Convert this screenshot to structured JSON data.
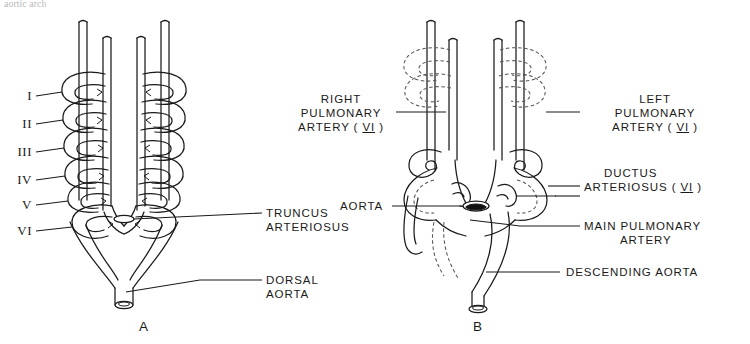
{
  "figure": {
    "top_cropped_text": "aortic arch",
    "panels": [
      {
        "id": "A",
        "letter": "A"
      },
      {
        "id": "B",
        "letter": "B"
      }
    ]
  },
  "arch_numerals": [
    {
      "label": "I",
      "arch": 1
    },
    {
      "label": "II",
      "arch": 2
    },
    {
      "label": "III",
      "arch": 3
    },
    {
      "label": "IV",
      "arch": 4
    },
    {
      "label": "V",
      "arch": 5
    },
    {
      "label": "VI",
      "arch": 6
    }
  ],
  "panel_a_labels": {
    "truncus_line1": "TRUNCUS",
    "truncus_line2": "ARTERIOSUS",
    "dorsal_line1": "DORSAL",
    "dorsal_line2": "AORTA"
  },
  "panel_b_labels": {
    "right_pa_line1": "RIGHT",
    "right_pa_line2": "PULMONARY",
    "right_pa_line3_pre": "ARTERY ( ",
    "right_pa_numeral": "VI",
    "right_pa_line3_post": " )",
    "left_pa_line1": "LEFT",
    "left_pa_line2": "PULMONARY",
    "left_pa_line3_pre": "ARTERY ( ",
    "left_pa_numeral": "VI",
    "left_pa_line3_post": " )",
    "ductus_line1": "DUCTUS",
    "ductus_line2_pre": "ARTERIOSUS ( ",
    "ductus_numeral": "VI",
    "ductus_line2_post": " )",
    "aorta": "AORTA",
    "main_pa_line1": "MAIN PULMONARY",
    "main_pa_line2": "ARTERY",
    "descending_aorta": "DESCENDING AORTA"
  },
  "colors": {
    "ink": "#1a1a1a",
    "background": "#ffffff",
    "regressed_stroke": "#555555"
  }
}
